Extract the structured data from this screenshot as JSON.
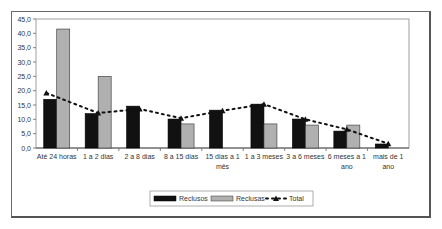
{
  "chart_data": {
    "type": "bar",
    "title": "",
    "xlabel": "",
    "ylabel": "",
    "ylim": [
      0,
      45
    ],
    "yticks": [
      "0,0",
      "5,0",
      "10,0",
      "15,0",
      "20,0",
      "25,0",
      "30,0",
      "35,0",
      "40,0",
      "45,0"
    ],
    "grid": false,
    "legend_position": "bottom",
    "categories": [
      [
        "Até 24 horas"
      ],
      [
        "1 a 2 dias"
      ],
      [
        "2 a 8 dias"
      ],
      [
        "8 a 15 dias"
      ],
      [
        "15 dias a 1",
        "mês"
      ],
      [
        "1 a 3 meses"
      ],
      [
        "3 a 6 meses"
      ],
      [
        "6 meses a 1",
        "ano"
      ],
      [
        "mais de 1",
        "ano"
      ]
    ],
    "series": [
      {
        "name": "Reclusos",
        "type": "bar",
        "color": "#111111",
        "values": [
          17.0,
          12.0,
          14.6,
          10.1,
          13.2,
          15.3,
          10.1,
          5.9,
          1.4
        ]
      },
      {
        "name": "Reclusas",
        "type": "bar",
        "color": "#b0b0b0",
        "values": [
          41.5,
          25.0,
          0,
          8.4,
          0,
          8.4,
          8.0,
          8.0,
          0
        ]
      },
      {
        "name": "Total",
        "type": "line",
        "style": "dotted",
        "marker": "triangle",
        "color": "#111111",
        "values": [
          19.2,
          12.2,
          13.6,
          10.4,
          13.0,
          15.3,
          10.0,
          6.5,
          1.5
        ]
      }
    ]
  },
  "legend": {
    "items": [
      {
        "label": "Reclusos"
      },
      {
        "label": "Reclusas"
      },
      {
        "label": "Total"
      }
    ]
  }
}
